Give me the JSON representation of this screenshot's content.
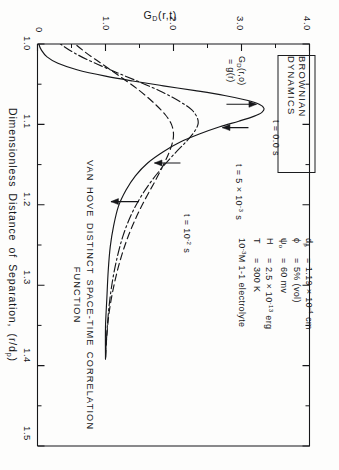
{
  "figure": {
    "legend_box_label": "BROWNIAN  DYNAMICS",
    "caption_line1": "VAN HOVE DISTINCT SPACE-TIME CORRELATION",
    "caption_line2": "FUNCTION",
    "line_color": "#16171a",
    "background": "#fdfdfc"
  },
  "parameters": [
    {
      "symbol": "d",
      "sub": "p",
      "eq": "=",
      "value": "1.19 × 10",
      "exp": "-4",
      "unit": "cm"
    },
    {
      "symbol": "ϕ",
      "sub": "",
      "eq": "=",
      "value": "5% (vol)",
      "exp": "",
      "unit": ""
    },
    {
      "symbol": "ψ",
      "sub": "o",
      "eq": "=",
      "value": "60 mv",
      "exp": "",
      "unit": ""
    },
    {
      "symbol": "H",
      "sub": "",
      "eq": "=",
      "value": "2.5 × 10",
      "exp": "-13",
      "unit": "erg"
    },
    {
      "symbol": "T",
      "sub": "",
      "eq": "=",
      "value": "300 K",
      "exp": "",
      "unit": ""
    }
  ],
  "parameter_footnote": {
    "prefix": "10",
    "exp": "-3",
    "text": "M  1-1 electrolyte"
  },
  "annotations": {
    "t0_label": "t = 0.0 s",
    "t1_prefix": "t = 5 × 10",
    "t1_exp": "-3",
    "t1_suffix": " s",
    "t2_prefix": "t = 10",
    "t2_exp": "-2",
    "t2_suffix": " s",
    "g_line1_prefix": "G",
    "g_line1_sub": "D",
    "g_line1_rest": "(r,o)",
    "g_line2": "= g(r)"
  },
  "chart_data": {
    "type": "line",
    "title": "VAN HOVE DISTINCT SPACE-TIME CORRELATION FUNCTION",
    "xlabel_prefix": "Dimensionless  Distance  of  Separation,  (r/d",
    "xlabel_sub": "p",
    "xlabel_suffix": ")",
    "ylabel_prefix": "G",
    "ylabel_sub": "D",
    "ylabel_suffix": "(r,t)",
    "xlim": [
      1.0,
      1.5
    ],
    "ylim": [
      0.0,
      4.0
    ],
    "xticks": [
      "1.0",
      "1.1",
      "1.2",
      "1.3",
      "1.4",
      "1.5"
    ],
    "xtick_values": [
      1.0,
      1.1,
      1.2,
      1.3,
      1.4,
      1.5
    ],
    "xminor_values": [
      1.05,
      1.15,
      1.25,
      1.35,
      1.45
    ],
    "yticks": [
      "0",
      "1.0",
      "2.0",
      "3.0",
      "4.0"
    ],
    "ytick_values": [
      0,
      1.0,
      2.0,
      3.0,
      4.0
    ],
    "yminor_values": [
      0.5,
      1.5,
      2.5,
      3.5
    ],
    "grid": false,
    "legend_position": "upper-left-box",
    "series": [
      {
        "name": "t = 0.0 s",
        "style": "solid",
        "points": [
          [
            0.962,
            0.0
          ],
          [
            0.975,
            0.0
          ],
          [
            0.99,
            0.005
          ],
          [
            1.0,
            0.02
          ],
          [
            1.008,
            0.06
          ],
          [
            1.016,
            0.14
          ],
          [
            1.024,
            0.3
          ],
          [
            1.032,
            0.58
          ],
          [
            1.04,
            1.0
          ],
          [
            1.046,
            1.4
          ],
          [
            1.052,
            1.85
          ],
          [
            1.058,
            2.32
          ],
          [
            1.064,
            2.75
          ],
          [
            1.07,
            3.08
          ],
          [
            1.075,
            3.26
          ],
          [
            1.08,
            3.33
          ],
          [
            1.085,
            3.3
          ],
          [
            1.09,
            3.18
          ],
          [
            1.096,
            2.96
          ],
          [
            1.103,
            2.68
          ],
          [
            1.112,
            2.38
          ],
          [
            1.122,
            2.1
          ],
          [
            1.134,
            1.85
          ],
          [
            1.148,
            1.62
          ],
          [
            1.164,
            1.44
          ],
          [
            1.182,
            1.3
          ],
          [
            1.202,
            1.19
          ],
          [
            1.226,
            1.12
          ],
          [
            1.252,
            1.07
          ],
          [
            1.282,
            1.04
          ],
          [
            1.316,
            1.02
          ],
          [
            1.352,
            1.0
          ],
          [
            1.392,
            1.0
          ]
        ]
      },
      {
        "name": "t = 5 x 10^-3 s",
        "style": "dashdot",
        "points": [
          [
            0.93,
            0.0
          ],
          [
            0.952,
            0.02
          ],
          [
            0.97,
            0.07
          ],
          [
            0.986,
            0.17
          ],
          [
            1.0,
            0.34
          ],
          [
            1.012,
            0.56
          ],
          [
            1.024,
            0.85
          ],
          [
            1.036,
            1.18
          ],
          [
            1.048,
            1.52
          ],
          [
            1.06,
            1.84
          ],
          [
            1.072,
            2.1
          ],
          [
            1.082,
            2.27
          ],
          [
            1.092,
            2.35
          ],
          [
            1.1,
            2.36
          ],
          [
            1.11,
            2.3
          ],
          [
            1.122,
            2.18
          ],
          [
            1.136,
            2.02
          ],
          [
            1.152,
            1.85
          ],
          [
            1.17,
            1.68
          ],
          [
            1.19,
            1.52
          ],
          [
            1.212,
            1.38
          ],
          [
            1.238,
            1.26
          ],
          [
            1.266,
            1.17
          ],
          [
            1.296,
            1.1
          ],
          [
            1.328,
            1.05
          ],
          [
            1.36,
            1.02
          ],
          [
            1.392,
            1.0
          ]
        ]
      },
      {
        "name": "t = 10^-2 s",
        "style": "dashed",
        "points": [
          [
            0.908,
            0.0
          ],
          [
            0.932,
            0.04
          ],
          [
            0.954,
            0.12
          ],
          [
            0.974,
            0.26
          ],
          [
            0.992,
            0.45
          ],
          [
            1.01,
            0.7
          ],
          [
            1.026,
            0.97
          ],
          [
            1.042,
            1.24
          ],
          [
            1.058,
            1.5
          ],
          [
            1.074,
            1.72
          ],
          [
            1.088,
            1.88
          ],
          [
            1.1,
            1.97
          ],
          [
            1.112,
            2.0
          ],
          [
            1.124,
            1.98
          ],
          [
            1.138,
            1.92
          ],
          [
            1.154,
            1.83
          ],
          [
            1.172,
            1.72
          ],
          [
            1.192,
            1.59
          ],
          [
            1.214,
            1.46
          ],
          [
            1.24,
            1.33
          ],
          [
            1.268,
            1.22
          ],
          [
            1.298,
            1.13
          ],
          [
            1.33,
            1.06
          ],
          [
            1.362,
            1.02
          ],
          [
            1.392,
            1.0
          ]
        ]
      }
    ],
    "arrow_annotations": [
      {
        "label": "t = 0.0 s",
        "target_x": 1.104,
        "target_y": 2.72
      },
      {
        "label": "t = 5 x 10^-3 s",
        "target_x": 1.148,
        "target_y": 1.72
      },
      {
        "label": "t = 10^-2 s",
        "target_x": 1.196,
        "target_y": 1.08
      },
      {
        "label": "G_D(r,o) = g(r)",
        "target_x": 1.075,
        "target_y": 3.3
      }
    ]
  }
}
